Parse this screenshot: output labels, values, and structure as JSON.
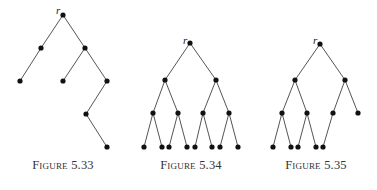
{
  "figures": [
    {
      "caption": "Figure 5.33",
      "caption_x": 63,
      "root_label": "r",
      "root_label_pos": [
        56,
        14
      ],
      "nodes": [
        [
          63,
          15
        ],
        [
          41,
          48
        ],
        [
          85,
          48
        ],
        [
          20,
          81
        ],
        [
          63,
          81
        ],
        [
          107,
          81
        ],
        [
          86,
          114
        ],
        [
          107,
          147
        ]
      ],
      "edges": [
        [
          0,
          1
        ],
        [
          0,
          2
        ],
        [
          1,
          3
        ],
        [
          2,
          4
        ],
        [
          2,
          5
        ],
        [
          5,
          6
        ],
        [
          6,
          7
        ]
      ]
    },
    {
      "caption": "Figure 5.34",
      "caption_x": 191,
      "root_label": "r",
      "root_label_pos": [
        183,
        44
      ],
      "nodes": [
        [
          190,
          43
        ],
        [
          165,
          80
        ],
        [
          216,
          80
        ],
        [
          153,
          113
        ],
        [
          178,
          113
        ],
        [
          203,
          113
        ],
        [
          229,
          113
        ],
        [
          144,
          147
        ],
        [
          162,
          147
        ],
        [
          169,
          147
        ],
        [
          187,
          147
        ],
        [
          195,
          147
        ],
        [
          212,
          147
        ],
        [
          220,
          147
        ],
        [
          238,
          147
        ]
      ],
      "edges": [
        [
          0,
          1
        ],
        [
          0,
          2
        ],
        [
          1,
          3
        ],
        [
          1,
          4
        ],
        [
          2,
          5
        ],
        [
          2,
          6
        ],
        [
          3,
          7
        ],
        [
          3,
          8
        ],
        [
          4,
          9
        ],
        [
          4,
          10
        ],
        [
          5,
          11
        ],
        [
          5,
          12
        ],
        [
          6,
          13
        ],
        [
          6,
          14
        ]
      ]
    },
    {
      "caption": "Figure 5.35",
      "caption_x": 316,
      "root_label": "r",
      "root_label_pos": [
        313,
        44
      ],
      "nodes": [
        [
          320,
          44
        ],
        [
          295,
          80
        ],
        [
          345,
          80
        ],
        [
          282,
          113
        ],
        [
          307,
          113
        ],
        [
          333,
          113
        ],
        [
          358,
          113
        ],
        [
          273,
          147
        ],
        [
          291,
          147
        ],
        [
          298,
          147
        ],
        [
          316,
          147
        ],
        [
          323,
          147
        ]
      ],
      "edges": [
        [
          0,
          1
        ],
        [
          0,
          2
        ],
        [
          1,
          3
        ],
        [
          1,
          4
        ],
        [
          2,
          5
        ],
        [
          2,
          6
        ],
        [
          3,
          7
        ],
        [
          3,
          8
        ],
        [
          4,
          9
        ],
        [
          4,
          10
        ],
        [
          5,
          11
        ]
      ]
    }
  ]
}
